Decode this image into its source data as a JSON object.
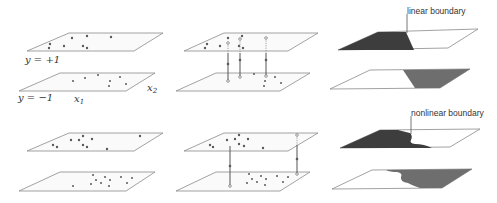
{
  "figure": {
    "labels": {
      "y_pos": "y = +1",
      "y_neg": "y = −1",
      "x1": "x",
      "x1_sub": "1",
      "x2": "x",
      "x2_sub": "2",
      "linear_boundary": "linear boundary",
      "nonlinear_boundary": "nonlinear boundary"
    },
    "rows": [
      {
        "name": "linear-example",
        "columns": [
          "data-points",
          "paired-points",
          "linear-boundary-regions"
        ]
      },
      {
        "name": "nonlinear-example",
        "columns": [
          "data-points",
          "paired-points",
          "nonlinear-boundary-regions"
        ]
      }
    ],
    "colors": {
      "plane_edge": "#8a8a8a",
      "dark_region": "#3d3d3d",
      "mid_region": "#6e6e6e",
      "points": "#5a5a5a"
    }
  }
}
